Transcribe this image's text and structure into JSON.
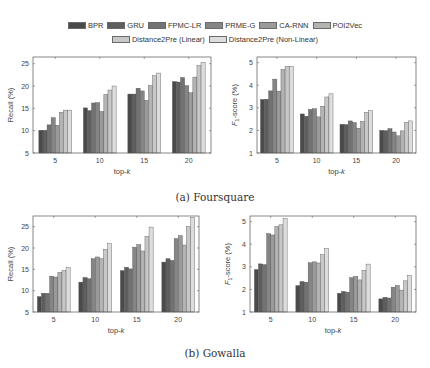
{
  "legend": {
    "items": [
      {
        "label": "BPR",
        "color": "#4a4a4a"
      },
      {
        "label": "GRU",
        "color": "#5e5e5e"
      },
      {
        "label": "FPMC-LR",
        "color": "#727272"
      },
      {
        "label": "PRME-G",
        "color": "#858585"
      },
      {
        "label": "CA-RNN",
        "color": "#9a9a9a"
      },
      {
        "label": "POI2Vec",
        "color": "#b3b3b3"
      },
      {
        "label": "Distance2Pre (Linear)",
        "color": "#c8c8c8"
      },
      {
        "label": "Distance2Pre (Non-Linear)",
        "color": "#dddddd"
      }
    ]
  },
  "captions": {
    "a": "(a)  Foursquare",
    "b": "(b)  Gowalla"
  },
  "chart_data": [
    {
      "id": "foursquare-recall",
      "type": "bar",
      "title": "",
      "dataset": "Foursquare",
      "xlabel": "top-k",
      "ylabel": "Recall (%)",
      "ylim": [
        5,
        26.5
      ],
      "yticks": [
        5,
        10,
        15,
        20,
        25
      ],
      "categories": [
        "5",
        "10",
        "15",
        "20"
      ],
      "series": [
        {
          "name": "BPR",
          "values": [
            10.1,
            15.1,
            18.2,
            21.0
          ]
        },
        {
          "name": "GRU",
          "values": [
            10.1,
            14.5,
            18.2,
            20.9
          ]
        },
        {
          "name": "FPMC-LR",
          "values": [
            11.3,
            16.2,
            19.5,
            21.9
          ]
        },
        {
          "name": "PRME-G",
          "values": [
            12.9,
            16.3,
            18.9,
            20.1
          ]
        },
        {
          "name": "CA-RNN",
          "values": [
            11.2,
            14.3,
            16.8,
            18.5
          ]
        },
        {
          "name": "POI2Vec",
          "values": [
            14.1,
            18.1,
            20.1,
            22.0
          ]
        },
        {
          "name": "Distance2Pre (Linear)",
          "values": [
            14.6,
            19.1,
            22.3,
            24.6
          ]
        },
        {
          "name": "Distance2Pre (Non-Linear)",
          "values": [
            14.6,
            20.0,
            22.9,
            25.3
          ]
        }
      ],
      "grid": false,
      "legend_position": "top"
    },
    {
      "id": "foursquare-f1",
      "type": "bar",
      "title": "",
      "dataset": "Foursquare",
      "xlabel": "top-k",
      "ylabel": "F1-score (%)",
      "ylim": [
        1,
        5.25
      ],
      "yticks": [
        1,
        2,
        3,
        4,
        5
      ],
      "categories": [
        "5",
        "10",
        "15",
        "20"
      ],
      "series": [
        {
          "name": "BPR",
          "values": [
            3.37,
            2.73,
            2.27,
            2.0
          ]
        },
        {
          "name": "GRU",
          "values": [
            3.38,
            2.63,
            2.26,
            1.99
          ]
        },
        {
          "name": "FPMC-LR",
          "values": [
            3.75,
            2.93,
            2.42,
            2.08
          ]
        },
        {
          "name": "PRME-G",
          "values": [
            4.27,
            2.96,
            2.35,
            1.93
          ]
        },
        {
          "name": "CA-RNN",
          "values": [
            3.74,
            2.6,
            2.1,
            1.76
          ]
        },
        {
          "name": "POI2Vec",
          "values": [
            4.7,
            3.07,
            2.4,
            1.98
          ]
        },
        {
          "name": "Distance2Pre (Linear)",
          "values": [
            4.83,
            3.48,
            2.8,
            2.35
          ]
        },
        {
          "name": "Distance2Pre (Non-Linear)",
          "values": [
            4.83,
            3.62,
            2.87,
            2.42
          ]
        }
      ],
      "grid": false,
      "legend_position": "top"
    },
    {
      "id": "gowalla-recall",
      "type": "bar",
      "title": "",
      "dataset": "Gowalla",
      "xlabel": "top-k",
      "ylabel": "Recall (%)",
      "ylim": [
        5,
        27.5
      ],
      "yticks": [
        5,
        10,
        15,
        20,
        25
      ],
      "categories": [
        "5",
        "10",
        "15",
        "20"
      ],
      "series": [
        {
          "name": "BPR",
          "values": [
            8.6,
            12.0,
            14.7,
            16.7
          ]
        },
        {
          "name": "GRU",
          "values": [
            9.4,
            13.1,
            15.5,
            17.5
          ]
        },
        {
          "name": "FPMC-LR",
          "values": [
            9.4,
            12.8,
            15.1,
            17.1
          ]
        },
        {
          "name": "PRME-G",
          "values": [
            13.4,
            17.5,
            20.2,
            22.2
          ]
        },
        {
          "name": "CA-RNN",
          "values": [
            13.2,
            17.9,
            20.8,
            22.9
          ]
        },
        {
          "name": "POI2Vec",
          "values": [
            14.3,
            17.5,
            19.3,
            20.7
          ]
        },
        {
          "name": "Distance2Pre (Linear)",
          "values": [
            14.7,
            19.7,
            22.7,
            25.0
          ]
        },
        {
          "name": "Distance2Pre (Non-Linear)",
          "values": [
            15.4,
            21.0,
            24.9,
            27.2
          ]
        }
      ],
      "grid": false,
      "legend_position": "top"
    },
    {
      "id": "gowalla-f1",
      "type": "bar",
      "title": "",
      "dataset": "Gowalla",
      "xlabel": "top-k",
      "ylabel": "F1-score (%)",
      "ylim": [
        1,
        5.25
      ],
      "yticks": [
        1,
        2,
        3,
        4,
        5
      ],
      "categories": [
        "5",
        "10",
        "15",
        "20"
      ],
      "series": [
        {
          "name": "BPR",
          "values": [
            2.88,
            2.17,
            1.83,
            1.58
          ]
        },
        {
          "name": "GRU",
          "values": [
            3.13,
            2.35,
            1.91,
            1.65
          ]
        },
        {
          "name": "FPMC-LR",
          "values": [
            3.1,
            2.32,
            1.88,
            1.62
          ]
        },
        {
          "name": "PRME-G",
          "values": [
            4.47,
            3.18,
            2.52,
            2.1
          ]
        },
        {
          "name": "CA-RNN",
          "values": [
            4.41,
            3.22,
            2.58,
            2.18
          ]
        },
        {
          "name": "POI2Vec",
          "values": [
            4.78,
            3.17,
            2.42,
            1.97
          ]
        },
        {
          "name": "Distance2Pre (Linear)",
          "values": [
            4.86,
            3.54,
            2.85,
            2.38
          ]
        },
        {
          "name": "Distance2Pre (Non-Linear)",
          "values": [
            5.13,
            3.81,
            3.12,
            2.62
          ]
        }
      ],
      "grid": false,
      "legend_position": "top"
    }
  ]
}
